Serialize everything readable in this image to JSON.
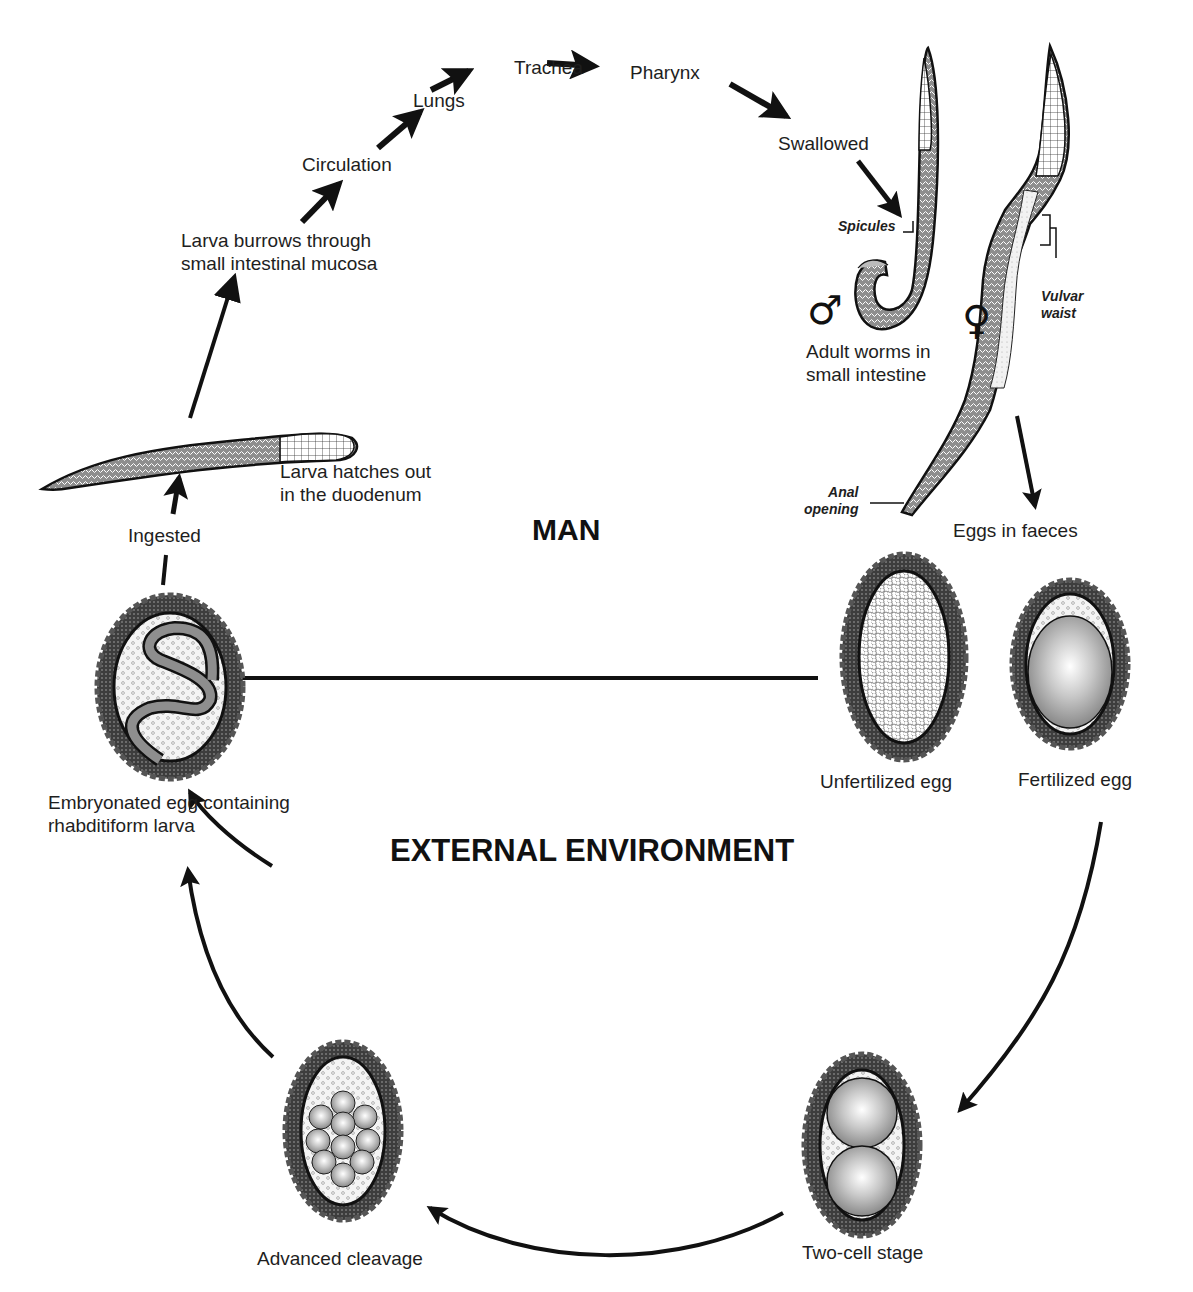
{
  "diagram": {
    "zones": {
      "man": "MAN",
      "external": "EXTERNAL ENVIRONMENT"
    },
    "migration_path": {
      "larva_burrows": "Larva burrows through\nsmall intestinal mucosa",
      "circulation": "Circulation",
      "lungs": "Lungs",
      "trachea": "Trachea",
      "pharynx": "Pharynx",
      "swallowed": "Swallowed"
    },
    "adults": {
      "caption": "Adult worms in\nsmall intestine",
      "male_symbol": "♂",
      "female_symbol": "♀",
      "spicules": "Spicules",
      "vulvar_waist": "Vulvar\nwaist",
      "anal_opening": "Anal\nopening",
      "eggs_in_faeces": "Eggs in faeces"
    },
    "eggs": {
      "unfertilized": "Unfertilized egg",
      "fertilized": "Fertilized egg",
      "two_cell": "Two-cell stage",
      "advanced_cleavage": "Advanced cleavage",
      "embryonated": "Embryonated egg containing\nrhabditiform larva"
    },
    "hatching": {
      "ingested": "Ingested",
      "larva_hatches": "Larva hatches out\nin the duodenum"
    },
    "colors": {
      "ink": "#1a1a1a",
      "shell_dark": "#4a4a4a",
      "cell_grey": "#9a9a9a",
      "background": "#ffffff"
    }
  }
}
